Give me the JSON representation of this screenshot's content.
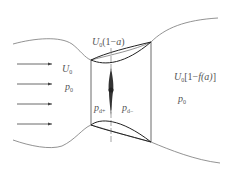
{
  "diagram": {
    "labels": {
      "upstream_velocity": {
        "main": "U",
        "sub": "0"
      },
      "upstream_pressure": {
        "main": "p",
        "sub": "0"
      },
      "disk_velocity": {
        "main": "U",
        "sub": "0",
        "rest": "(1−",
        "var": "a",
        "close": ")"
      },
      "pressure_front": {
        "main": "p",
        "sub": "d+"
      },
      "pressure_back": {
        "main": "p",
        "sub": "d−"
      },
      "wake_velocity": {
        "main": "U",
        "sub": "0",
        "rest": "[1−",
        "var": "f(a)",
        "close": "]"
      },
      "wake_pressure": {
        "main": "p",
        "sub": "0"
      }
    },
    "arrows_count": 4,
    "colors": {
      "line": "#555555",
      "dark": "#222222",
      "text": "#555555"
    }
  }
}
